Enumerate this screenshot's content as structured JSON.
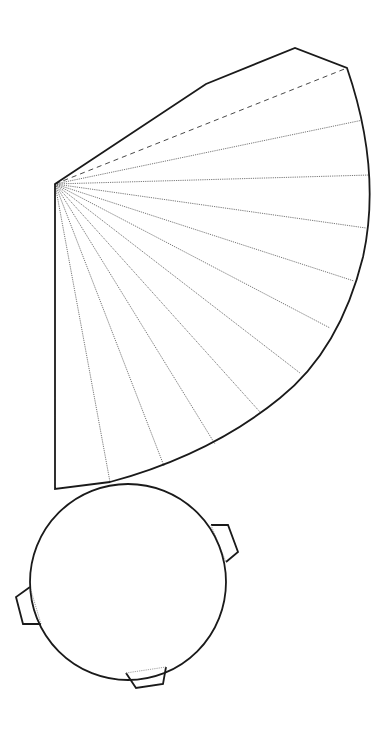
{
  "diagram": {
    "type": "cone-net",
    "colors": {
      "outline": "#1a1a1a",
      "fold_lines": "#555555",
      "background": "#ffffff"
    },
    "sector": {
      "apex": [
        55,
        184
      ],
      "outline_path": "M55,184 L206,84 L295,48 L347,68 Q382,170 363,257 Q340,350 280,398 Q210,455 110,482 L55,489 Z",
      "dashed_line_end": [
        347,
        68
      ],
      "fold_line_ends": [
        [
          363,
          120
        ],
        [
          370,
          175
        ],
        [
          366,
          228
        ],
        [
          354,
          281
        ],
        [
          330,
          328
        ],
        [
          300,
          373
        ],
        [
          260,
          412
        ],
        [
          215,
          444
        ],
        [
          164,
          466
        ],
        [
          110,
          482
        ]
      ]
    },
    "base_circle": {
      "center": [
        128,
        582
      ],
      "radius": 98,
      "tabs": [
        {
          "name": "right",
          "points": "211,525 228,525 238,552 226,562"
        },
        {
          "name": "left",
          "points": "30,587 16,597 23,624 41,624"
        },
        {
          "name": "bottom",
          "points": "126,673 136,688 163,684 166,667"
        }
      ]
    }
  }
}
